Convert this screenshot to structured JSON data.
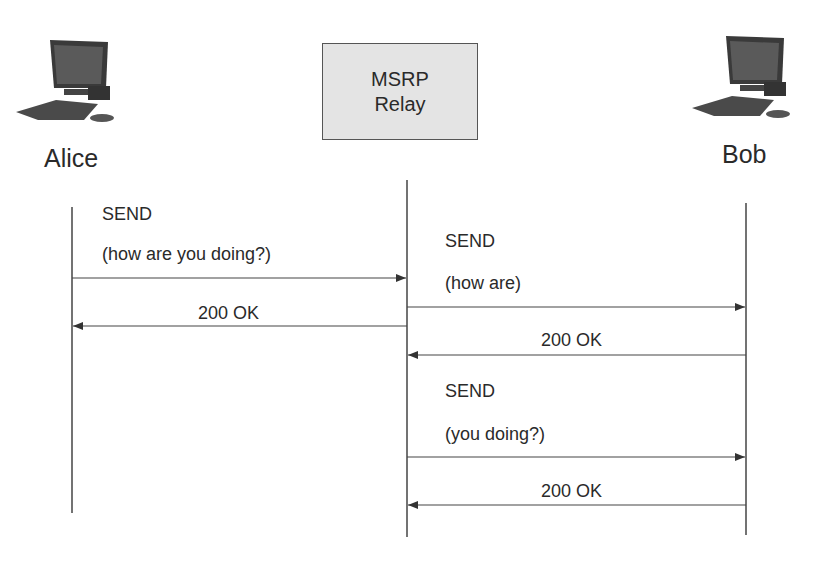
{
  "diagram": {
    "type": "sequence-diagram",
    "participants": [
      {
        "id": "alice",
        "name": "Alice",
        "icon": "desktop-computer-icon"
      },
      {
        "id": "relay",
        "name_line1": "MSRP",
        "name_line2": "Relay"
      },
      {
        "id": "bob",
        "name": "Bob",
        "icon": "desktop-computer-icon"
      }
    ],
    "messages": [
      {
        "from": "Alice",
        "to": "MSRP Relay",
        "method": "SEND",
        "body": "(how are you doing?)"
      },
      {
        "from": "MSRP Relay",
        "to": "Alice",
        "method": "200 OK"
      },
      {
        "from": "MSRP Relay",
        "to": "Bob",
        "method": "SEND",
        "body": "(how are)"
      },
      {
        "from": "Bob",
        "to": "MSRP Relay",
        "method": "200 OK"
      },
      {
        "from": "MSRP Relay",
        "to": "Bob",
        "method": "SEND",
        "body": "(you doing?)"
      },
      {
        "from": "Bob",
        "to": "MSRP Relay",
        "method": "200 OK"
      }
    ],
    "colors": {
      "line": "#444444",
      "relay_fill": "#e4e4e4"
    }
  }
}
